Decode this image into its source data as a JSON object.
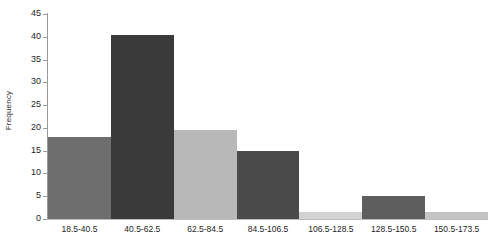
{
  "chart_data": {
    "type": "bar",
    "title": "",
    "xlabel": "",
    "ylabel": "Frequency",
    "categories": [
      "18.5-40.5",
      "40.5-62.5",
      "62.5-84.5",
      "84.5-106.5",
      "106.5-128.5",
      "128.5-150.5",
      "150.5-173.5"
    ],
    "values": [
      18,
      40.5,
      19.5,
      15,
      1.5,
      5,
      1.5
    ],
    "bar_colors": [
      "#6e6e6e",
      "#3a3a3a",
      "#b8b8b8",
      "#4a4a4a",
      "#d2d2d2",
      "#5e5e5e",
      "#c4c4c4"
    ],
    "ylim": [
      0,
      45
    ],
    "yticks": [
      0,
      5,
      10,
      15,
      20,
      25,
      30,
      35,
      40,
      45
    ],
    "ytick_labels": [
      "0",
      "5",
      "10",
      "15",
      "20",
      "25",
      "30",
      "35",
      "40",
      "45"
    ],
    "grid": false,
    "legend": false,
    "bar_gap": 0
  },
  "axes": {
    "y_axis_title": "Frequency"
  },
  "caption": {
    "text": ""
  }
}
